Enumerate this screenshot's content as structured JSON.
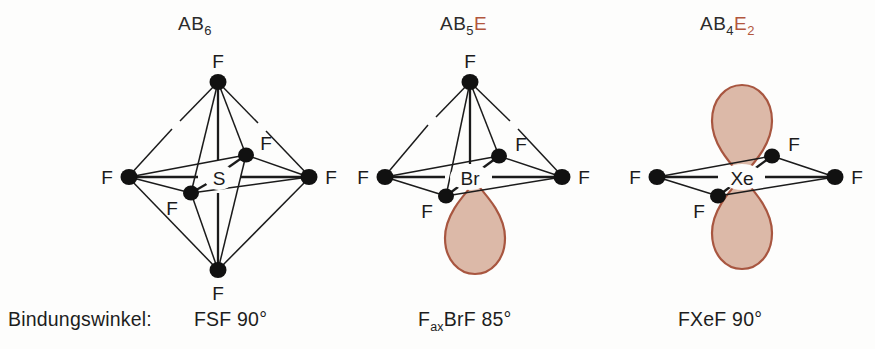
{
  "figure": {
    "caption_prefix": "Bindungswinkel:",
    "background": "#fdfdfc",
    "lobe_fill": "#dcb9a8",
    "lobe_stroke": "#a85640",
    "bond_color": "#1b1b1b",
    "atom_color": "#111111",
    "accent_color": "#b2563d"
  },
  "structures": [
    {
      "id": "sf6",
      "title_main": "AB",
      "title_sub": "6",
      "title_lone": "",
      "title_lone_sub": "",
      "center_atom": "S",
      "ligand_label": "F",
      "ligands": [
        "F",
        "F",
        "F",
        "F",
        "F",
        "F"
      ],
      "lone_pairs": 0,
      "geometry": "octahedral",
      "bond_angle_caption": "FSF 90°",
      "angle_atoms": "FSF",
      "angle_value": "90°"
    },
    {
      "id": "brf5",
      "title_main": "AB",
      "title_sub": "5",
      "title_lone": "E",
      "title_lone_sub": "",
      "center_atom": "Br",
      "ligand_label": "F",
      "ligands": [
        "F",
        "F",
        "F",
        "F",
        "F"
      ],
      "lone_pairs": 1,
      "geometry": "square pyramidal",
      "bond_angle_caption": "FaxBrF 85°",
      "angle_atoms_pre": "F",
      "angle_atoms_sub": "ax",
      "angle_atoms_post": "BrF",
      "angle_value": "85°"
    },
    {
      "id": "xef4",
      "title_main": "AB",
      "title_sub": "4",
      "title_lone": "E",
      "title_lone_sub": "2",
      "center_atom": "Xe",
      "ligand_label": "F",
      "ligands": [
        "F",
        "F",
        "F",
        "F"
      ],
      "lone_pairs": 2,
      "geometry": "square planar",
      "bond_angle_caption": "FXeF 90°",
      "angle_atoms": "FXeF",
      "angle_value": "90°"
    }
  ]
}
